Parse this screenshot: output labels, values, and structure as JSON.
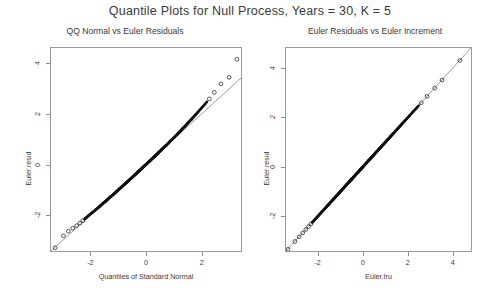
{
  "figure": {
    "title": "Quantile Plots for Null Process, Years = 30, K = 5",
    "background": "#ffffff",
    "point_color": "#111111",
    "line_color": "#6f6f6f",
    "frame_color": "#9a9a9a"
  },
  "panels": [
    {
      "title": "QQ Normal vs Euler Residuals",
      "xlabel": "Quantiles of Standard Normal",
      "ylabel": "Euler.resid",
      "xticks": [
        "-2",
        "0",
        "2"
      ],
      "yticks": [
        "4",
        "2",
        "0",
        "-2"
      ]
    },
    {
      "title": "Euler Residuals vs Euler Increment",
      "xlabel": "Euler.tru",
      "ylabel": "Euler.resid",
      "xticks": [
        "-2",
        "0",
        "2",
        "4"
      ],
      "yticks": [
        "4",
        "2",
        "0",
        "-2"
      ]
    }
  ],
  "chart_data": [
    {
      "type": "scatter",
      "title": "QQ Normal vs Euler Residuals",
      "xlabel": "Quantiles of Standard Normal",
      "ylabel": "Euler.resid",
      "xlim": [
        -3.45,
        3.45
      ],
      "ylim": [
        -3.45,
        4.65
      ],
      "xtick_values": [
        -2,
        0,
        2
      ],
      "ytick_values": [
        4,
        2,
        0,
        -2
      ],
      "grid": false,
      "legend": "none",
      "reference_line": {
        "type": "qqline",
        "slope": 1.0,
        "intercept": 0.0,
        "x_from": -3.45,
        "x_to": 3.45
      },
      "series": [
        {
          "name": "Euler residual quantiles",
          "marker": "open-circle",
          "x": [
            -3.3,
            -3.0,
            -2.82,
            -2.66,
            -2.52,
            -2.4,
            -2.29,
            -2.19,
            -2.1,
            -2.02,
            -1.94,
            -1.86,
            -1.79,
            -1.72,
            -1.66,
            -1.6,
            -1.54,
            -1.48,
            -1.43,
            -1.38,
            -1.33,
            -1.28,
            -1.23,
            -1.18,
            -1.14,
            -1.09,
            -1.05,
            -1.01,
            -0.97,
            -0.93,
            -0.89,
            -0.85,
            -0.81,
            -0.77,
            -0.73,
            -0.7,
            -0.66,
            -0.62,
            -0.59,
            -0.55,
            -0.52,
            -0.48,
            -0.45,
            -0.41,
            -0.38,
            -0.34,
            -0.31,
            -0.28,
            -0.24,
            -0.21,
            -0.17,
            -0.14,
            -0.11,
            -0.07,
            -0.04,
            -0.01,
            0.03,
            0.06,
            0.09,
            0.13,
            0.16,
            0.19,
            0.23,
            0.26,
            0.3,
            0.33,
            0.37,
            0.4,
            0.44,
            0.47,
            0.51,
            0.55,
            0.58,
            0.62,
            0.66,
            0.7,
            0.74,
            0.78,
            0.82,
            0.86,
            0.9,
            0.95,
            0.99,
            1.04,
            1.09,
            1.14,
            1.19,
            1.25,
            1.3,
            1.36,
            1.43,
            1.49,
            1.56,
            1.64,
            1.72,
            1.81,
            1.91,
            2.02,
            2.15,
            2.3,
            2.48,
            2.72,
            3.02,
            3.3
          ],
          "y": [
            -3.32,
            -2.84,
            -2.66,
            -2.54,
            -2.44,
            -2.34,
            -2.24,
            -2.14,
            -2.05,
            -1.98,
            -1.91,
            -1.84,
            -1.77,
            -1.71,
            -1.65,
            -1.59,
            -1.53,
            -1.48,
            -1.43,
            -1.38,
            -1.33,
            -1.28,
            -1.24,
            -1.19,
            -1.15,
            -1.1,
            -1.06,
            -1.02,
            -0.98,
            -0.94,
            -0.9,
            -0.86,
            -0.82,
            -0.78,
            -0.74,
            -0.71,
            -0.67,
            -0.63,
            -0.6,
            -0.56,
            -0.53,
            -0.49,
            -0.46,
            -0.42,
            -0.39,
            -0.35,
            -0.32,
            -0.28,
            -0.25,
            -0.21,
            -0.18,
            -0.14,
            -0.11,
            -0.07,
            -0.04,
            -0.01,
            0.03,
            0.06,
            0.1,
            0.13,
            0.17,
            0.2,
            0.24,
            0.27,
            0.31,
            0.34,
            0.38,
            0.42,
            0.45,
            0.49,
            0.53,
            0.57,
            0.61,
            0.65,
            0.69,
            0.73,
            0.77,
            0.82,
            0.86,
            0.91,
            0.95,
            1.0,
            1.05,
            1.1,
            1.16,
            1.21,
            1.27,
            1.33,
            1.4,
            1.47,
            1.54,
            1.62,
            1.7,
            1.79,
            1.89,
            2.0,
            2.12,
            2.26,
            2.42,
            2.62,
            2.88,
            3.22,
            3.48,
            4.2
          ]
        }
      ],
      "annotations": [
        "lower tail points fall below the reference line",
        "upper tail points lie above the reference line"
      ]
    },
    {
      "type": "scatter",
      "title": "Euler Residuals vs Euler Increment",
      "xlabel": "Euler.tru",
      "ylabel": "Euler.resid",
      "xlim": [
        -3.45,
        4.85
      ],
      "ylim": [
        -3.45,
        4.85
      ],
      "xtick_values": [
        -2,
        0,
        2,
        4
      ],
      "ytick_values": [
        4,
        2,
        0,
        -2
      ],
      "grid": false,
      "legend": "none",
      "reference_line": {
        "type": "identity",
        "slope": 1.0,
        "intercept": 0.0,
        "x_from": -3.45,
        "x_to": 4.85
      },
      "series": [
        {
          "name": "Euler residual vs true increment",
          "marker": "open-circle",
          "x": [
            -3.36,
            -3.05,
            -2.86,
            -2.7,
            -2.56,
            -2.44,
            -2.33,
            -2.23,
            -2.14,
            -2.05,
            -1.97,
            -1.89,
            -1.82,
            -1.75,
            -1.69,
            -1.62,
            -1.56,
            -1.5,
            -1.45,
            -1.39,
            -1.34,
            -1.29,
            -1.24,
            -1.19,
            -1.15,
            -1.1,
            -1.06,
            -1.01,
            -0.97,
            -0.93,
            -0.89,
            -0.85,
            -0.81,
            -0.77,
            -0.74,
            -0.7,
            -0.66,
            -0.62,
            -0.59,
            -0.55,
            -0.52,
            -0.48,
            -0.45,
            -0.41,
            -0.38,
            -0.34,
            -0.31,
            -0.27,
            -0.24,
            -0.21,
            -0.17,
            -0.14,
            -0.11,
            -0.07,
            -0.04,
            -0.01,
            0.03,
            0.06,
            0.1,
            0.13,
            0.17,
            0.2,
            0.24,
            0.27,
            0.31,
            0.34,
            0.38,
            0.42,
            0.45,
            0.49,
            0.53,
            0.57,
            0.61,
            0.65,
            0.69,
            0.73,
            0.77,
            0.82,
            0.86,
            0.91,
            0.95,
            1.0,
            1.05,
            1.1,
            1.16,
            1.21,
            1.27,
            1.33,
            1.4,
            1.47,
            1.54,
            1.62,
            1.7,
            1.79,
            1.89,
            2.0,
            2.12,
            2.26,
            2.42,
            2.62,
            2.88,
            3.22,
            3.55,
            4.35
          ],
          "y": [
            -3.38,
            -3.06,
            -2.87,
            -2.71,
            -2.57,
            -2.45,
            -2.34,
            -2.24,
            -2.15,
            -2.06,
            -1.98,
            -1.9,
            -1.83,
            -1.76,
            -1.7,
            -1.63,
            -1.57,
            -1.51,
            -1.46,
            -1.4,
            -1.35,
            -1.3,
            -1.25,
            -1.2,
            -1.16,
            -1.11,
            -1.07,
            -1.02,
            -0.98,
            -0.94,
            -0.9,
            -0.86,
            -0.82,
            -0.78,
            -0.75,
            -0.71,
            -0.67,
            -0.63,
            -0.6,
            -0.56,
            -0.53,
            -0.49,
            -0.46,
            -0.42,
            -0.39,
            -0.35,
            -0.32,
            -0.28,
            -0.25,
            -0.22,
            -0.18,
            -0.15,
            -0.12,
            -0.08,
            -0.05,
            -0.02,
            0.02,
            0.05,
            0.09,
            0.12,
            0.16,
            0.19,
            0.23,
            0.26,
            0.3,
            0.33,
            0.37,
            0.41,
            0.44,
            0.48,
            0.52,
            0.56,
            0.6,
            0.64,
            0.68,
            0.72,
            0.76,
            0.81,
            0.85,
            0.9,
            0.94,
            0.99,
            1.04,
            1.09,
            1.15,
            1.2,
            1.26,
            1.32,
            1.39,
            1.46,
            1.53,
            1.61,
            1.69,
            1.78,
            1.88,
            1.99,
            2.11,
            2.25,
            2.41,
            2.61,
            2.87,
            3.21,
            3.54,
            4.34
          ]
        }
      ],
      "annotations": [
        "points align almost exactly on the identity line"
      ]
    }
  ]
}
